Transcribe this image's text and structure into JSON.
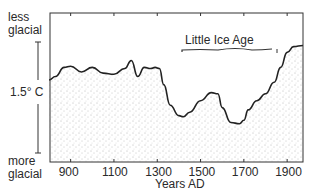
{
  "chart_data": {
    "type": "area",
    "title": "",
    "xlabel": "Years AD",
    "ylabel_top": "less glacial",
    "ylabel_bottom": "more glacial",
    "scale_bar_label": "1.5° C",
    "x_ticks": [
      900,
      1100,
      1300,
      1500,
      1700,
      1900
    ],
    "xlim": [
      800,
      1970
    ],
    "grid": false,
    "fill": "stippled",
    "annotation": {
      "text": "Little Ice Age",
      "x_start": 1400,
      "x_end": 1800
    },
    "series": [
      {
        "name": "Relative temperature (glacial index)",
        "x": [
          800,
          830,
          870,
          900,
          950,
          1000,
          1050,
          1100,
          1150,
          1180,
          1210,
          1240,
          1270,
          1290,
          1310,
          1330,
          1360,
          1400,
          1420,
          1450,
          1500,
          1550,
          1580,
          1600,
          1640,
          1680,
          1700,
          1720,
          1760,
          1800,
          1840,
          1870,
          1900,
          1930,
          1960
        ],
        "y": [
          0.0,
          0.15,
          0.55,
          0.6,
          0.35,
          0.55,
          0.3,
          0.25,
          0.5,
          0.85,
          0.15,
          0.55,
          0.5,
          0.55,
          0.5,
          -0.2,
          -1.1,
          -1.55,
          -1.6,
          -1.4,
          -0.9,
          -0.55,
          -0.6,
          -1.2,
          -1.85,
          -1.9,
          -1.75,
          -1.3,
          -0.9,
          -0.6,
          -0.1,
          0.55,
          1.2,
          1.45,
          1.5
        ]
      }
    ]
  }
}
